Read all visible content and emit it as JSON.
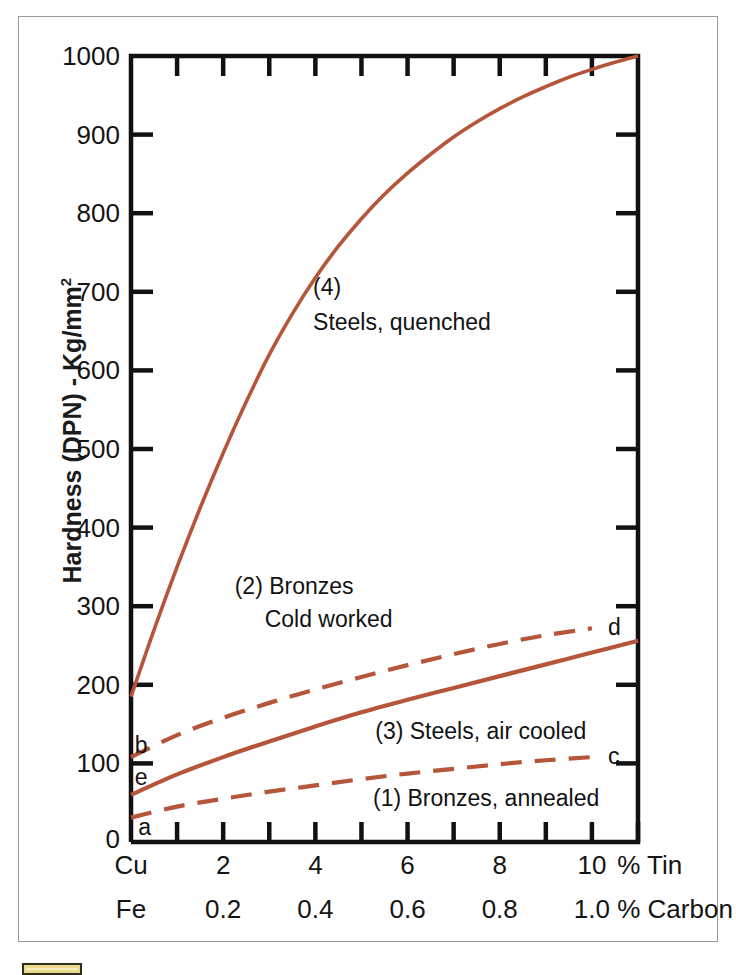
{
  "figure": {
    "axis_color": "#111111",
    "curve_color": "#b5553a",
    "frame_color": "#9a9a9a",
    "ylabel_text": "Hardness (DPN) - Kg/mm",
    "ylabel_sup": "2",
    "x_axis_name_top": "% Tin",
    "x_axis_name_bottom": "% Carbon",
    "x_origin_label_top": "Cu",
    "x_origin_label_bottom": "Fe"
  },
  "chart_data": {
    "type": "line",
    "title": "",
    "xlabel": "% Tin / % Carbon",
    "ylabel": "Hardness (DPN) - Kg/mm2",
    "xlim": [
      0,
      11
    ],
    "ylim": [
      0,
      1000
    ],
    "grid": false,
    "legend": "in-plot annotations",
    "y_ticks": [
      0,
      100,
      200,
      300,
      400,
      500,
      600,
      700,
      800,
      900,
      1000
    ],
    "y_tick_labels": [
      "0",
      "100",
      "200",
      "300",
      "400",
      "500",
      "600",
      "700",
      "800",
      "900",
      "1000"
    ],
    "x_ticks": [
      0,
      1,
      2,
      3,
      4,
      5,
      6,
      7,
      8,
      9,
      10,
      11
    ],
    "x_tick_labels_tin": [
      "Cu",
      "",
      "2",
      "",
      "4",
      "",
      "6",
      "",
      "8",
      "",
      "10",
      ""
    ],
    "x_tick_labels_carbon": [
      "Fe",
      "",
      "0.2",
      "",
      "0.4",
      "",
      "0.6",
      "",
      "0.8",
      "",
      "1.0",
      ""
    ],
    "series": [
      {
        "name": "(4) Steels, quenched",
        "tag": "",
        "style": "solid",
        "x": [
          0,
          0.5,
          1,
          1.5,
          2,
          2.5,
          3,
          3.5,
          4,
          4.5,
          5,
          5.5,
          6,
          6.5,
          7,
          7.5,
          8,
          8.5,
          9,
          9.5,
          10,
          10.5,
          11
        ],
        "y": [
          185,
          270,
          350,
          425,
          495,
          560,
          620,
          672,
          718,
          758,
          793,
          824,
          851,
          875,
          897,
          916,
          933,
          948,
          961,
          973,
          983,
          992,
          1000
        ]
      },
      {
        "name": "(2) Bronzes, cold worked",
        "tag": "d",
        "style": "dashed",
        "x": [
          0,
          1,
          2,
          3,
          4,
          5,
          6,
          7,
          8,
          9,
          10
        ],
        "y": [
          108,
          136,
          158,
          177,
          194,
          210,
          225,
          239,
          252,
          263,
          272
        ]
      },
      {
        "name": "(3) Steels, air cooled",
        "tag": "e",
        "style": "solid",
        "x": [
          0,
          1,
          2,
          3,
          4,
          5,
          6,
          7,
          8,
          9,
          10,
          11
        ],
        "y": [
          60,
          86,
          108,
          128,
          147,
          165,
          181,
          196,
          211,
          226,
          241,
          256
        ]
      },
      {
        "name": "(1) Bronzes, annealed",
        "tag": "c",
        "style": "dashed",
        "x": [
          0,
          1,
          2,
          3,
          4,
          5,
          6,
          7,
          8,
          9,
          10
        ],
        "y": [
          31,
          45,
          55,
          64,
          72,
          80,
          87,
          93,
          99,
          104,
          108
        ]
      }
    ],
    "annotations": [
      {
        "id": "note-4-number",
        "text": "(4)",
        "x": 3.95,
        "y": 705
      },
      {
        "id": "note-4-text",
        "text": "Steels, quenched",
        "x": 3.95,
        "y": 660
      },
      {
        "id": "note-2-number",
        "text": "(2) Bronzes",
        "x": 2.25,
        "y": 325
      },
      {
        "id": "note-2-text",
        "text": "Cold worked",
        "x": 2.9,
        "y": 282
      },
      {
        "id": "note-3-text",
        "text": "(3) Steels, air cooled",
        "x": 5.3,
        "y": 140
      },
      {
        "id": "note-1-text",
        "text": "(1) Bronzes, annealed",
        "x": 5.25,
        "y": 55
      },
      {
        "id": "point-b",
        "text": "b",
        "x": 0.08,
        "y": 122
      },
      {
        "id": "point-e",
        "text": "e",
        "x": 0.08,
        "y": 82
      },
      {
        "id": "point-a",
        "text": "a",
        "x": 0.16,
        "y": 18
      },
      {
        "id": "point-d",
        "text": "d",
        "x": 10.35,
        "y": 272
      },
      {
        "id": "point-c",
        "text": "c",
        "x": 10.35,
        "y": 108
      }
    ]
  }
}
